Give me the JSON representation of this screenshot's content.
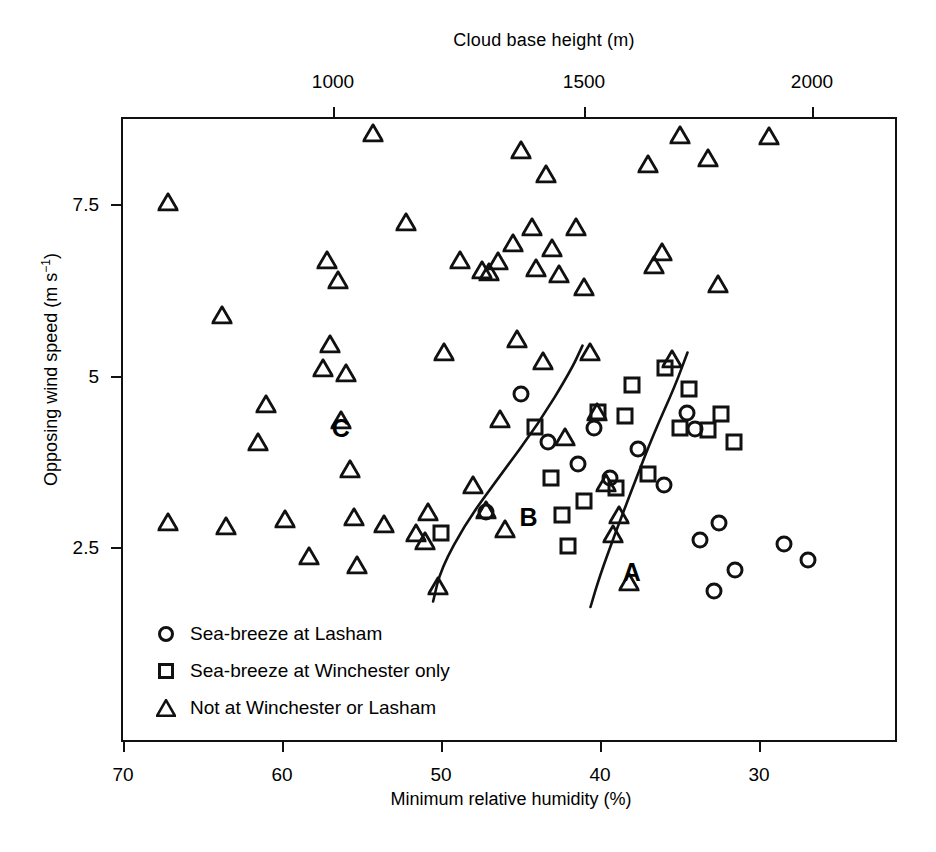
{
  "chart_data": {
    "type": "scatter",
    "title": "",
    "xlabel": "Minimum relative humidity (%)",
    "ylabel": "Opposing wind speed (m s⁻¹)",
    "top_axis_label": "Cloud base height (m)",
    "xlim": [
      70,
      25
    ],
    "ylim": [
      1.6,
      8.9
    ],
    "x_ticks": [
      70,
      60,
      50,
      40,
      30
    ],
    "x_tick_labels": [
      "70",
      "60",
      "50",
      "40",
      "30"
    ],
    "top_ticks": [
      1000,
      1500,
      2000
    ],
    "top_tick_labels": [
      "1000",
      "1500",
      "2000"
    ],
    "y_ticks": [
      7.5,
      5,
      2.5
    ],
    "y_tick_labels": [
      "7.5",
      "5",
      "2.5"
    ],
    "grid": false,
    "legend_position": "lower-left-inside",
    "annotations": [
      {
        "text": "A",
        "x": 38.0,
        "y": 2.15
      },
      {
        "text": "B",
        "x": 44.5,
        "y": 2.95
      },
      {
        "text": "C",
        "x": 56.3,
        "y": 4.25
      }
    ],
    "series": [
      {
        "name": "Sea-breeze at Lasham",
        "marker": "circle",
        "points": [
          [
            45.0,
            4.75
          ],
          [
            43.3,
            4.05
          ],
          [
            41.4,
            3.73
          ],
          [
            40.4,
            4.25
          ],
          [
            39.4,
            3.52
          ],
          [
            37.6,
            3.95
          ],
          [
            36.0,
            3.42
          ],
          [
            34.5,
            4.47
          ],
          [
            33.7,
            2.62
          ],
          [
            32.5,
            2.86
          ],
          [
            31.5,
            2.18
          ],
          [
            32.8,
            1.88
          ],
          [
            28.4,
            2.56
          ],
          [
            26.9,
            2.32
          ],
          [
            47.2,
            3.03
          ],
          [
            34.0,
            4.23
          ]
        ]
      },
      {
        "name": "Sea-breeze at Winchester only",
        "marker": "square",
        "points": [
          [
            44.1,
            4.27
          ],
          [
            43.1,
            3.52
          ],
          [
            42.4,
            2.98
          ],
          [
            42.0,
            2.53
          ],
          [
            41.0,
            3.18
          ],
          [
            40.1,
            4.48
          ],
          [
            39.0,
            3.37
          ],
          [
            38.4,
            4.43
          ],
          [
            38.0,
            4.88
          ],
          [
            37.0,
            3.58
          ],
          [
            35.9,
            5.13
          ],
          [
            35.0,
            4.25
          ],
          [
            34.4,
            4.82
          ],
          [
            33.2,
            4.22
          ],
          [
            32.4,
            4.45
          ],
          [
            31.6,
            4.05
          ],
          [
            50.0,
            2.72
          ]
        ]
      },
      {
        "name": "Not at Winchester or Lasham",
        "marker": "triangle",
        "points": [
          [
            67.2,
            7.55
          ],
          [
            63.8,
            5.9
          ],
          [
            67.2,
            2.88
          ],
          [
            63.5,
            2.82
          ],
          [
            61.0,
            4.6
          ],
          [
            61.5,
            4.05
          ],
          [
            59.8,
            2.93
          ],
          [
            58.3,
            2.38
          ],
          [
            57.2,
            6.7
          ],
          [
            56.5,
            6.4
          ],
          [
            57.0,
            5.48
          ],
          [
            57.4,
            5.12
          ],
          [
            56.0,
            5.05
          ],
          [
            56.3,
            4.37
          ],
          [
            55.7,
            3.65
          ],
          [
            55.5,
            2.95
          ],
          [
            55.3,
            2.25
          ],
          [
            54.3,
            8.55
          ],
          [
            53.6,
            2.85
          ],
          [
            52.2,
            7.25
          ],
          [
            51.6,
            2.72
          ],
          [
            51.0,
            2.6
          ],
          [
            50.2,
            1.95
          ],
          [
            50.8,
            3.02
          ],
          [
            49.8,
            5.35
          ],
          [
            48.8,
            6.7
          ],
          [
            48.0,
            3.42
          ],
          [
            47.4,
            6.55
          ],
          [
            47.0,
            6.52
          ],
          [
            47.2,
            3.05
          ],
          [
            46.4,
            6.68
          ],
          [
            46.3,
            4.38
          ],
          [
            45.5,
            6.95
          ],
          [
            45.2,
            5.55
          ],
          [
            45.0,
            8.3
          ],
          [
            44.3,
            7.18
          ],
          [
            44.0,
            6.58
          ],
          [
            43.6,
            5.22
          ],
          [
            43.4,
            7.95
          ],
          [
            43.0,
            6.88
          ],
          [
            42.6,
            6.5
          ],
          [
            42.2,
            4.12
          ],
          [
            41.5,
            7.18
          ],
          [
            41.0,
            6.3
          ],
          [
            40.6,
            5.35
          ],
          [
            40.2,
            4.48
          ],
          [
            39.6,
            3.45
          ],
          [
            39.2,
            2.7
          ],
          [
            38.8,
            2.98
          ],
          [
            38.2,
            2.0
          ],
          [
            37.0,
            8.1
          ],
          [
            36.6,
            6.62
          ],
          [
            36.1,
            6.82
          ],
          [
            35.5,
            5.25
          ],
          [
            35.0,
            8.52
          ],
          [
            33.2,
            8.18
          ],
          [
            32.6,
            6.35
          ],
          [
            29.4,
            8.5
          ],
          [
            46.0,
            2.78
          ]
        ]
      }
    ],
    "divider_curves": [
      {
        "name": "curve-B-C",
        "points": [
          [
            50.5,
            1.72
          ],
          [
            50.0,
            2.2
          ],
          [
            48.4,
            2.88
          ],
          [
            46.3,
            3.55
          ],
          [
            43.9,
            4.3
          ],
          [
            41.8,
            5.1
          ],
          [
            41.1,
            5.45
          ]
        ]
      },
      {
        "name": "curve-A-B",
        "points": [
          [
            40.6,
            1.64
          ],
          [
            40.0,
            2.1
          ],
          [
            39.1,
            2.68
          ],
          [
            38.0,
            3.35
          ],
          [
            36.6,
            4.18
          ],
          [
            35.3,
            4.85
          ],
          [
            34.5,
            5.35
          ]
        ]
      }
    ]
  },
  "legend": {
    "items": [
      {
        "marker": "circle-marker",
        "label": "Sea-breeze at Lasham"
      },
      {
        "marker": "square-marker",
        "label": "Sea-breeze at Winchester only"
      },
      {
        "marker": "triangle-marker",
        "label": "Not at Winchester or Lasham"
      }
    ]
  },
  "colors": {
    "ink": "#111111",
    "background": "#ffffff"
  }
}
